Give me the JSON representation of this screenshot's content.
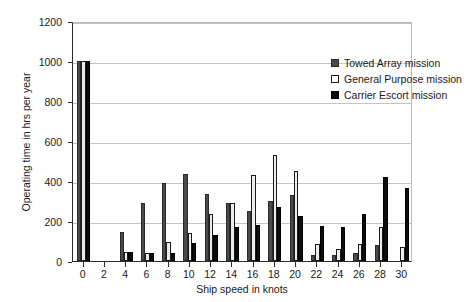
{
  "chart_data": {
    "type": "bar",
    "title": "",
    "xlabel": "Ship speed in knots",
    "ylabel": "Operating time in hrs per year",
    "categories": [
      "0",
      "2",
      "4",
      "6",
      "8",
      "10",
      "12",
      "14",
      "16",
      "18",
      "20",
      "22",
      "24",
      "26",
      "28",
      "30"
    ],
    "ylim": [
      0,
      1200
    ],
    "yticks": [
      0,
      200,
      400,
      600,
      800,
      1000,
      1200
    ],
    "grid": true,
    "legend_position": "top-right",
    "series": [
      {
        "name": "Towed Array mission",
        "color": "#4a4a4a",
        "values": [
          1000,
          0,
          145,
          290,
          390,
          435,
          335,
          290,
          250,
          300,
          330,
          30,
          30,
          40,
          80,
          0
        ]
      },
      {
        "name": "General Purpose mission",
        "color": "#ffffff",
        "values": [
          1000,
          0,
          45,
          40,
          95,
          140,
          235,
          290,
          430,
          530,
          450,
          85,
          60,
          85,
          170,
          70
        ]
      },
      {
        "name": "Carrier Escort mission",
        "color": "#0d0d0d",
        "values": [
          1000,
          0,
          45,
          40,
          40,
          90,
          130,
          170,
          180,
          270,
          225,
          175,
          170,
          235,
          420,
          365
        ]
      }
    ]
  }
}
